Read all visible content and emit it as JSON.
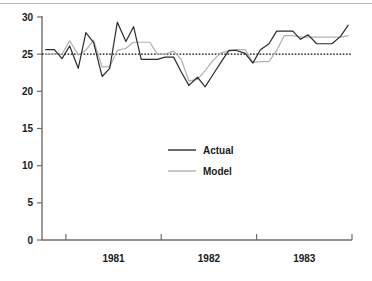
{
  "chart_data": {
    "type": "line",
    "title": "",
    "xlabel": "",
    "ylabel": "",
    "ylim": [
      0,
      30
    ],
    "yticks": [
      0,
      5,
      10,
      15,
      20,
      25,
      30
    ],
    "ytick_labels": [
      "0",
      "5",
      "10",
      "15",
      "20",
      "25",
      "30"
    ],
    "xtick_labels": [
      "1981",
      "1982",
      "1983"
    ],
    "xlim": [
      1980.75,
      1984.0
    ],
    "x_axis_tick_positions": [
      1981.0,
      1982.0,
      1983.0
    ],
    "x_label_positions": [
      1981.5,
      1982.5,
      1983.5
    ],
    "grid": false,
    "legend_position": "center",
    "reference_line": {
      "label": "25 reference",
      "value": 25,
      "style": "dotted",
      "color": "#000000"
    },
    "series": [
      {
        "name": "Actual",
        "color": "#2b2b2b",
        "style": "solid",
        "x": [
          1980.79,
          1980.88,
          1980.96,
          1981.04,
          1981.13,
          1981.21,
          1981.29,
          1981.38,
          1981.46,
          1981.54,
          1981.63,
          1981.71,
          1981.79,
          1981.88,
          1981.96,
          1982.04,
          1982.13,
          1982.21,
          1982.29,
          1982.38,
          1982.46,
          1982.54,
          1982.63,
          1982.71,
          1982.79,
          1982.88,
          1982.96,
          1983.04,
          1983.13,
          1983.21,
          1983.29,
          1983.38,
          1983.46,
          1983.54,
          1983.63,
          1983.71,
          1983.79,
          1983.88,
          1983.96
        ],
        "values": [
          25.6,
          25.6,
          24.4,
          26.1,
          23.1,
          27.9,
          26.6,
          22.0,
          23.1,
          29.3,
          26.7,
          28.7,
          24.3,
          24.3,
          24.3,
          24.6,
          24.6,
          22.6,
          20.8,
          21.9,
          20.6,
          22.2,
          24.0,
          25.5,
          25.5,
          25.1,
          23.8,
          25.6,
          26.4,
          28.1,
          28.1,
          28.1,
          27.0,
          27.6,
          26.4,
          26.4,
          26.4,
          27.4,
          28.9
        ]
      },
      {
        "name": "Model",
        "color": "#b0b0b0",
        "style": "solid",
        "x": [
          1980.79,
          1980.88,
          1980.96,
          1981.04,
          1981.13,
          1981.21,
          1981.29,
          1981.38,
          1981.46,
          1981.54,
          1981.63,
          1981.71,
          1981.79,
          1981.88,
          1981.96,
          1982.04,
          1982.13,
          1982.21,
          1982.29,
          1982.38,
          1982.46,
          1982.54,
          1982.63,
          1982.71,
          1982.79,
          1982.88,
          1982.96,
          1983.04,
          1983.13,
          1983.21,
          1983.29,
          1983.38,
          1983.46,
          1983.54,
          1983.63,
          1983.71,
          1983.79,
          1983.88,
          1983.96
        ],
        "values": [
          25.0,
          25.0,
          25.0,
          26.8,
          24.9,
          25.5,
          26.9,
          23.3,
          23.3,
          25.5,
          25.8,
          26.6,
          26.6,
          26.6,
          25.0,
          25.0,
          25.4,
          24.3,
          21.4,
          21.6,
          22.8,
          24.1,
          25.2,
          25.4,
          25.6,
          25.6,
          23.9,
          24.0,
          24.0,
          25.5,
          27.5,
          27.5,
          27.3,
          27.3,
          27.3,
          27.3,
          27.3,
          27.3,
          27.5
        ]
      }
    ]
  },
  "legend": {
    "entries": [
      {
        "label": "Actual"
      },
      {
        "label": "Model"
      }
    ]
  },
  "axes": {
    "y_axis_name": "value-axis",
    "x_axis_name": "time-axis"
  }
}
